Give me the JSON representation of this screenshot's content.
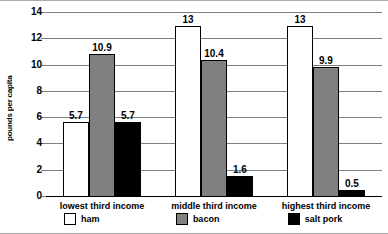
{
  "chart_data": {
    "type": "bar",
    "title": "",
    "xlabel": "",
    "ylabel": "pounds per capita",
    "ylim": [
      0,
      14
    ],
    "yticks": [
      "0",
      "2",
      "4",
      "6",
      "8",
      "10",
      "12",
      "14"
    ],
    "grid": true,
    "legend_position": "bottom",
    "categories": [
      "lowest third income",
      "middle third income",
      "highest third income"
    ],
    "series": [
      {
        "name": "ham",
        "color": "#ffffff",
        "values": [
          5.7,
          13,
          13
        ],
        "labels": [
          "5.7",
          "13",
          "13"
        ]
      },
      {
        "name": "bacon",
        "color": "#808080",
        "values": [
          10.9,
          10.4,
          9.9
        ],
        "labels": [
          "10.9",
          "10.4",
          "9.9"
        ]
      },
      {
        "name": "salt pork",
        "color": "#000000",
        "values": [
          5.7,
          1.6,
          0.5
        ],
        "labels": [
          "5.7",
          "1.6",
          "0.5"
        ]
      }
    ]
  },
  "legend": {
    "items": [
      {
        "label": "ham",
        "key": "ham"
      },
      {
        "label": "bacon",
        "key": "bacon"
      },
      {
        "label": "salt pork",
        "key": "salt"
      }
    ]
  },
  "colors": {
    "ham": "#ffffff",
    "bacon": "#808080",
    "salt_pork": "#000000",
    "gridline": "#7f7f7f",
    "axis": "#000000",
    "frame": "#aaaaaa"
  }
}
